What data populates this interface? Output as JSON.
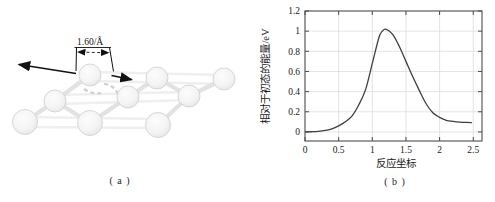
{
  "figure": {
    "panel_a_label": "( a )",
    "panel_b_label": "( b )"
  },
  "colors": {
    "arrow": "#111111",
    "atom_fill_center": "#fcfcfc",
    "atom_fill_edge": "#e4e4e4",
    "atom_edge": "#d2d2d2",
    "bond": "#e2e2e2",
    "bg_bond": "#efefef",
    "ghost": "#cfcfcf",
    "axis": "#4d4d4d",
    "grid": "#d9d9d9",
    "curve": "#3f3f3f",
    "text": "#1a1a1a"
  },
  "molecule": {
    "annotation": {
      "label": "1.60/Å",
      "label_x": 77,
      "label_y": 45,
      "underline": [
        74.5,
        47.5,
        111,
        47.5
      ],
      "ext_left": [
        76.5,
        47.5,
        76,
        71
      ],
      "ext_right": [
        109.5,
        47.5,
        113.5,
        71.5
      ],
      "dim": {
        "y1": 52.1,
        "y2": 52.7,
        "x_left": 78,
        "x_right": 108.5
      },
      "arrow_left": [
        76,
        73.5,
        19,
        64.5
      ],
      "arrow_right": [
        111.5,
        75.5,
        131.5,
        79.6
      ]
    },
    "atoms": [
      {
        "cx": 25,
        "cy": 122,
        "r": 12.5
      },
      {
        "cx": 55,
        "cy": 101,
        "r": 11
      },
      {
        "cx": 90,
        "cy": 75,
        "r": 11
      },
      {
        "cx": 90,
        "cy": 123,
        "r": 12.5
      },
      {
        "cx": 128,
        "cy": 97,
        "r": 11
      },
      {
        "cx": 157,
        "cy": 78,
        "r": 11
      },
      {
        "cx": 189,
        "cy": 96,
        "r": 11
      },
      {
        "cx": 224,
        "cy": 79,
        "r": 11
      },
      {
        "cx": 158,
        "cy": 125,
        "r": 12.5
      }
    ],
    "bonds": [
      [
        0,
        1
      ],
      [
        1,
        2
      ],
      [
        1,
        3
      ],
      [
        3,
        4
      ],
      [
        4,
        5
      ],
      [
        5,
        6
      ],
      [
        6,
        7
      ],
      [
        6,
        8
      ]
    ],
    "background_bonds": [
      [
        25,
        117,
        158,
        119
      ],
      [
        28,
        127,
        158,
        128
      ],
      [
        56,
        95,
        189,
        92
      ],
      [
        57,
        104,
        189,
        100
      ],
      [
        91,
        72,
        224,
        75
      ],
      [
        92,
        81,
        224,
        84
      ]
    ],
    "ghost_dashes": [
      "M84,89 Q93,95 101,93",
      "M104,84 Q114,85 118,94"
    ]
  },
  "chart_data": {
    "type": "line",
    "title": "",
    "xlabel": "反应坐标",
    "ylabel": "相对于初态的能量/eV",
    "xlim": [
      0,
      2.63
    ],
    "ylim": [
      -0.09,
      1.2
    ],
    "xticks": [
      0,
      0.5,
      1,
      1.5,
      2,
      2.5
    ],
    "xtick_labels": [
      "0",
      "0.5",
      "1",
      "1.5",
      "2",
      "2.5"
    ],
    "yticks": [
      0,
      0.2,
      0.4,
      0.6,
      0.8,
      1,
      1.2
    ],
    "ytick_labels": [
      "0",
      "0.2",
      "0.4",
      "0.6",
      "0.8",
      "1",
      "1.2"
    ],
    "grid": true,
    "legend": null,
    "series": [
      {
        "name": "energy-barrier",
        "x": [
          0,
          0.1,
          0.2,
          0.3,
          0.4,
          0.5,
          0.6,
          0.7,
          0.8,
          0.9,
          1.0,
          1.1,
          1.15,
          1.2,
          1.3,
          1.4,
          1.5,
          1.6,
          1.7,
          1.8,
          1.9,
          2.0,
          2.1,
          2.2,
          2.3,
          2.4,
          2.48
        ],
        "y": [
          0,
          0.002,
          0.006,
          0.015,
          0.03,
          0.06,
          0.1,
          0.16,
          0.27,
          0.42,
          0.68,
          0.94,
          1.0,
          1.02,
          0.97,
          0.85,
          0.7,
          0.55,
          0.41,
          0.28,
          0.19,
          0.145,
          0.115,
          0.105,
          0.098,
          0.094,
          0.093
        ]
      }
    ]
  }
}
